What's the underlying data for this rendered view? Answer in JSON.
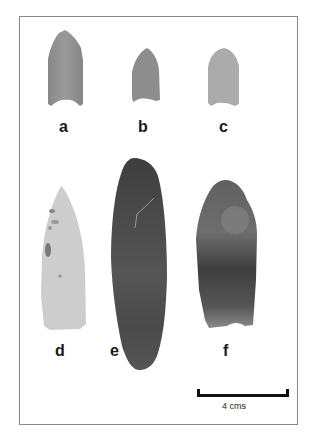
{
  "figure": {
    "artifacts": [
      {
        "id": "a",
        "label": "a",
        "color": "#8f8f8f",
        "shape": "fluted-point-notched-base"
      },
      {
        "id": "b",
        "label": "b",
        "color": "#8c8c8c",
        "shape": "small-point"
      },
      {
        "id": "c",
        "label": "c",
        "color": "#a8a8a8",
        "shape": "small-point-rounded"
      },
      {
        "id": "d",
        "label": "d",
        "color": "#cfcfcf",
        "shape": "lanceolate-light"
      },
      {
        "id": "e",
        "label": "e",
        "color": "#4a4a4a",
        "shape": "lanceolate-dark-long"
      },
      {
        "id": "f",
        "label": "f",
        "color": "#5e5e5e",
        "shape": "fluted-point-dark"
      }
    ],
    "scale_bar": {
      "label": "4 cms",
      "length_cm": 4
    }
  }
}
